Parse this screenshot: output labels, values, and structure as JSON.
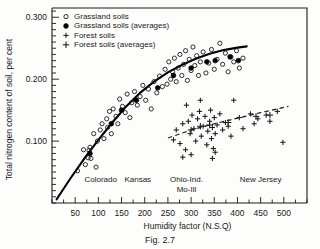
{
  "figure": {
    "caption": "Fig. 2.7"
  },
  "chart_data": {
    "type": "scatter",
    "title": "",
    "xlabel": "Humidity factor (N.S.Q)",
    "ylabel": "Total nitrogen content of soil, per cent",
    "xlim": [
      0,
      550
    ],
    "ylim": [
      0,
      0.315
    ],
    "grid": false,
    "legend_position": "top-left",
    "x_ticks_major": [
      50,
      100,
      150,
      200,
      250,
      300,
      350,
      400,
      450,
      500
    ],
    "x_tick_step_minor": 25,
    "y_ticks_major": [
      0.1,
      0.2,
      0.3
    ],
    "y_tick_labels": [
      "0.100",
      "0.200",
      "0.300"
    ],
    "y_tick_step_minor": 0.01,
    "legend": [
      {
        "marker": "open-circle",
        "label": "Grassland soils"
      },
      {
        "marker": "filled-circle",
        "label": "Grassland soils (averages)"
      },
      {
        "marker": "plus",
        "label": "Forest soils"
      },
      {
        "marker": "plus-bold",
        "label": "Forest soils (averages)"
      }
    ],
    "region_annotations": [
      {
        "label": "Colorado",
        "x": 105
      },
      {
        "label": "Kansas",
        "x": 185
      },
      {
        "label": "Ohio-Ind.",
        "x": 290,
        "line": 1
      },
      {
        "label": "Mo-Ill",
        "x": 290,
        "line": 2
      },
      {
        "label": "New Jersey",
        "x": 450
      }
    ],
    "series": [
      {
        "name": "Grassland soils",
        "marker": "open-circle",
        "points": [
          [
            55,
            0.052
          ],
          [
            68,
            0.086
          ],
          [
            72,
            0.062
          ],
          [
            78,
            0.073
          ],
          [
            80,
            0.085
          ],
          [
            82,
            0.09
          ],
          [
            84,
            0.072
          ],
          [
            90,
            0.112
          ],
          [
            95,
            0.058
          ],
          [
            98,
            0.1
          ],
          [
            104,
            0.118
          ],
          [
            108,
            0.128
          ],
          [
            112,
            0.104
          ],
          [
            118,
            0.136
          ],
          [
            120,
            0.122
          ],
          [
            124,
            0.148
          ],
          [
            128,
            0.112
          ],
          [
            132,
            0.152
          ],
          [
            138,
            0.14
          ],
          [
            142,
            0.128
          ],
          [
            146,
            0.168
          ],
          [
            152,
            0.156
          ],
          [
            158,
            0.146
          ],
          [
            162,
            0.176
          ],
          [
            168,
            0.138
          ],
          [
            172,
            0.162
          ],
          [
            178,
            0.18
          ],
          [
            184,
            0.158
          ],
          [
            190,
            0.172
          ],
          [
            196,
            0.19
          ],
          [
            202,
            0.166
          ],
          [
            208,
            0.184
          ],
          [
            214,
            0.152
          ],
          [
            220,
            0.196
          ],
          [
            226,
            0.178
          ],
          [
            232,
            0.205
          ],
          [
            238,
            0.188
          ],
          [
            244,
            0.216
          ],
          [
            248,
            0.192
          ],
          [
            252,
            0.228
          ],
          [
            256,
            0.2
          ],
          [
            260,
            0.212
          ],
          [
            264,
            0.234
          ],
          [
            268,
            0.196
          ],
          [
            272,
            0.218
          ],
          [
            276,
            0.24
          ],
          [
            280,
            0.206
          ],
          [
            284,
            0.224
          ],
          [
            288,
            0.246
          ],
          [
            292,
            0.198
          ],
          [
            296,
            0.232
          ],
          [
            300,
            0.214
          ],
          [
            304,
            0.252
          ],
          [
            308,
            0.222
          ],
          [
            312,
            0.238
          ],
          [
            316,
            0.206
          ],
          [
            320,
            0.228
          ],
          [
            326,
            0.244
          ],
          [
            332,
            0.21
          ],
          [
            338,
            0.226
          ],
          [
            344,
            0.248
          ],
          [
            350,
            0.216
          ],
          [
            356,
            0.232
          ],
          [
            362,
            0.258
          ],
          [
            368,
            0.224
          ],
          [
            374,
            0.242
          ],
          [
            380,
            0.212
          ],
          [
            386,
            0.236
          ],
          [
            392,
            0.228
          ],
          [
            398,
            0.246
          ],
          [
            404,
            0.218
          ],
          [
            412,
            0.234
          ]
        ]
      },
      {
        "name": "Grassland soils (averages)",
        "marker": "filled-circle",
        "points": [
          [
            82,
            0.08
          ],
          [
            128,
            0.128
          ],
          [
            150,
            0.15
          ],
          [
            182,
            0.166
          ],
          [
            228,
            0.186
          ],
          [
            262,
            0.206
          ],
          [
            300,
            0.218
          ],
          [
            334,
            0.228
          ],
          [
            352,
            0.23
          ],
          [
            384,
            0.236
          ],
          [
            402,
            0.23
          ]
        ]
      },
      {
        "name": "Forest soils",
        "marker": "plus",
        "points": [
          [
            262,
            0.102
          ],
          [
            268,
            0.118
          ],
          [
            276,
            0.096
          ],
          [
            282,
            0.128
          ],
          [
            288,
            0.086
          ],
          [
            294,
            0.132
          ],
          [
            298,
            0.112
          ],
          [
            302,
            0.142
          ],
          [
            306,
            0.12
          ],
          [
            310,
            0.1
          ],
          [
            314,
            0.136
          ],
          [
            318,
            0.148
          ],
          [
            322,
            0.108
          ],
          [
            326,
            0.124
          ],
          [
            330,
            0.14
          ],
          [
            334,
            0.094
          ],
          [
            336,
            0.116
          ],
          [
            340,
            0.132
          ],
          [
            342,
            0.15
          ],
          [
            344,
            0.104
          ],
          [
            346,
            0.122
          ],
          [
            348,
            0.088
          ],
          [
            350,
            0.138
          ],
          [
            352,
            0.112
          ],
          [
            356,
            0.126
          ],
          [
            362,
            0.144
          ],
          [
            368,
            0.118
          ],
          [
            374,
            0.13
          ],
          [
            380,
            0.124
          ],
          [
            386,
            0.108
          ],
          [
            392,
            0.166
          ],
          [
            404,
            0.138
          ],
          [
            412,
            0.12
          ],
          [
            428,
            0.144
          ],
          [
            436,
            0.128
          ],
          [
            444,
            0.136
          ],
          [
            462,
            0.142
          ],
          [
            470,
            0.132
          ],
          [
            486,
            0.148
          ],
          [
            498,
            0.098
          ],
          [
            320,
            0.166
          ],
          [
            290,
            0.158
          ],
          [
            346,
            0.072
          ],
          [
            352,
            0.082
          ],
          [
            300,
            0.078
          ],
          [
            282,
            0.074
          ]
        ]
      },
      {
        "name": "Forest soils (averages)",
        "marker": "plus-bold",
        "points": [
          [
            300,
            0.118
          ],
          [
            320,
            0.124
          ],
          [
            340,
            0.126
          ],
          [
            380,
            0.13
          ],
          [
            440,
            0.14
          ],
          [
            470,
            0.142
          ]
        ]
      }
    ],
    "trend_lines": [
      {
        "name": "grassland-trend",
        "style": "solid",
        "points": [
          [
            10,
            0.006
          ],
          [
            40,
            0.04
          ],
          [
            70,
            0.072
          ],
          [
            100,
            0.102
          ],
          [
            130,
            0.13
          ],
          [
            160,
            0.156
          ],
          [
            190,
            0.178
          ],
          [
            220,
            0.196
          ],
          [
            250,
            0.211
          ],
          [
            280,
            0.223
          ],
          [
            310,
            0.233
          ],
          [
            340,
            0.241
          ],
          [
            370,
            0.247
          ],
          [
            400,
            0.251
          ],
          [
            420,
            0.253
          ]
        ]
      },
      {
        "name": "forest-trend",
        "style": "dashed",
        "points": [
          [
            250,
            0.105
          ],
          [
            300,
            0.118
          ],
          [
            350,
            0.128
          ],
          [
            400,
            0.137
          ],
          [
            450,
            0.146
          ],
          [
            510,
            0.156
          ]
        ]
      }
    ]
  }
}
